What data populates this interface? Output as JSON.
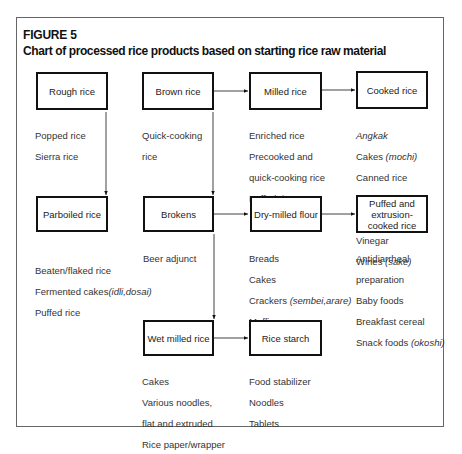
{
  "figure": {
    "label": "FIGURE 5",
    "title": "Chart of processed rice products based on starting rice raw material"
  },
  "nodes": {
    "rough_rice": {
      "label": "Rough rice",
      "products": [
        "Popped rice",
        "Sierra rice"
      ]
    },
    "brown_rice": {
      "label": "Brown rice",
      "products": [
        "Quick-cooking",
        "rice"
      ]
    },
    "milled_rice": {
      "label": "Milled rice",
      "products": [
        "Enriched rice",
        "Precooked and",
        "quick-cooking rice",
        "Puffed rice"
      ]
    },
    "cooked_rice": {
      "label": "Cooked rice",
      "products": [
        "Angkak",
        "Cakes",
        "(mochi)",
        "Canned rice",
        "Congee",
        "Mirin and miso",
        "Vinegar",
        "Wines",
        "(sake)"
      ]
    },
    "parboiled_rice": {
      "label": "Parboiled rice",
      "products": [
        "Beaten/flaked rice",
        "Fermented cakes",
        "(idli,dosai)",
        "Puffed rice"
      ]
    },
    "brokens": {
      "label": "Brokens",
      "products": [
        "Beer adjunct"
      ]
    },
    "dry_milled_flour": {
      "label": "Dry-milled flour",
      "products": [
        "Breads",
        "Cakes",
        "Crackers ",
        "(sembei,arare)",
        "Muffins",
        "Puddings"
      ]
    },
    "puffed_extrusion": {
      "label": "Puffed and extrusion-cooked rice",
      "products": [
        "Antidiarrheal",
        "preparation",
        "Baby foods",
        "Breakfast cereal",
        "Snack foods ",
        "(okoshi)"
      ]
    },
    "wet_milled_rice": {
      "label": "Wet milled rice",
      "products": [
        "Cakes",
        "Various noodles,",
        "flat and extruded",
        "Rice paper/wrapper"
      ]
    },
    "rice_starch": {
      "label": "Rice starch",
      "products": [
        "Food stabilizer",
        "Noodles",
        "Tablets"
      ]
    }
  },
  "edges": [
    [
      "Brown rice",
      "Milled rice"
    ],
    [
      "Milled rice",
      "Cooked rice"
    ],
    [
      "Rough rice",
      "Parboiled rice"
    ],
    [
      "Brown rice",
      "Brokens"
    ],
    [
      "Brokens",
      "Dry-milled flour"
    ],
    [
      "Dry-milled flour",
      "Puffed and extrusion-cooked rice"
    ],
    [
      "Brokens",
      "Wet milled rice"
    ],
    [
      "Wet milled rice",
      "Rice starch"
    ]
  ],
  "colors": {
    "line": "#111111",
    "text": "#222222",
    "frame": "#666666"
  }
}
